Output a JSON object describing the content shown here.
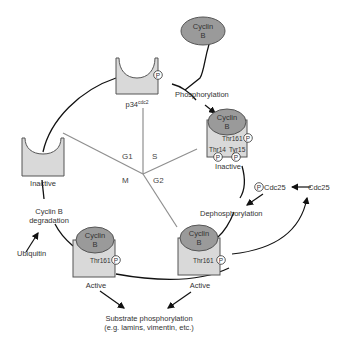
{
  "diagram": {
    "phases": [
      "G1",
      "S",
      "G2",
      "M"
    ],
    "labels": {
      "cyclin": "Cyclin",
      "cyclin_b": "B",
      "p34": "p34",
      "p34_sup": "cdc2",
      "phosphorylation": "Phosphorylation",
      "thr161": "Thr161",
      "thr14": "Thr14",
      "tyr15": "Tyr15",
      "inactive": "Inactive",
      "inactive_left": "Inactive",
      "dephosphorylation": "Dephosphorylation",
      "p_cdc25": "Cdc25",
      "cdc25": "Cdc25",
      "active_right": "Active",
      "active_left": "Active",
      "degradation_line1": "Cyclin B",
      "degradation_line2": "degradation",
      "ubiquitin": "Ubiquitin",
      "substrate_line1": "Substrate phosphorylation",
      "substrate_line2": "(e.g. lamins, vimentin, etc.)",
      "p_symbol": "P"
    },
    "colors": {
      "kinase_fill": "#d9d9d9",
      "cyclin_fill": "#9a9a9a",
      "phase_line": "#8f8f8f",
      "arrow": "#111111"
    }
  }
}
